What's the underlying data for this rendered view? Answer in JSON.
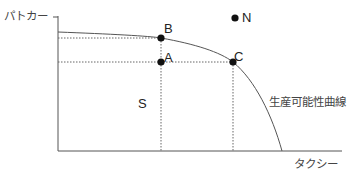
{
  "diagram": {
    "title": "",
    "y_axis_label": "パトカー",
    "x_axis_label": "タクシー",
    "curve_label": "生産可能性曲線",
    "region_label": "S",
    "points": [
      {
        "id": "A",
        "label": "A",
        "x": 161,
        "y": 62
      },
      {
        "id": "B",
        "label": "B",
        "x": 161,
        "y": 38
      },
      {
        "id": "C",
        "label": "C",
        "x": 233,
        "y": 62
      },
      {
        "id": "N",
        "label": "N",
        "x": 235,
        "y": 18
      }
    ],
    "colors": {
      "line": "#555555",
      "point": "#111111",
      "dotted": "#666666"
    }
  }
}
